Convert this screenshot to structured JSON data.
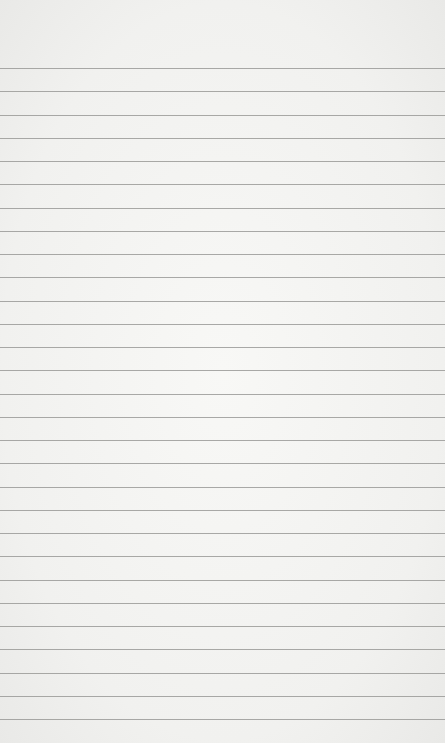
{
  "image": {
    "subject": "blank lined notebook paper",
    "background_color": "#f4f4f2",
    "rule_color": "#9a9a98",
    "first_rule_y": 68,
    "rule_spacing": 23.25,
    "rule_count": 29
  }
}
